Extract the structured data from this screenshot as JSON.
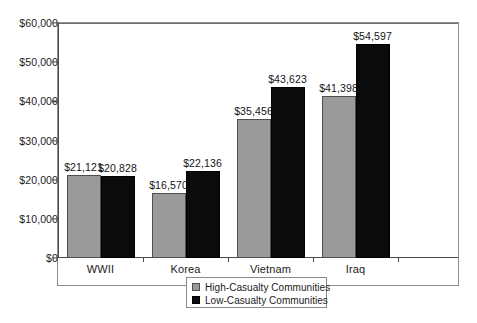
{
  "chart_data": {
    "type": "bar",
    "title": "",
    "subtitle": "",
    "xlabel": "",
    "ylabel": "",
    "categories": [
      "WWII",
      "Korea",
      "Vietnam",
      "Iraq"
    ],
    "series": [
      {
        "name": "High-Casualty Communities",
        "color": "#9a9a9a",
        "values": [
          21121,
          20828,
          16570,
          22136
        ],
        "values_by_category": [
          21121,
          16570,
          35456,
          41398
        ],
        "labels": [
          "$21,121",
          "$16,570",
          "$35,456",
          "$41,398"
        ]
      },
      {
        "name": "Low-Casualty Communities",
        "color": "#0b0b0b",
        "values_by_category": [
          20828,
          22136,
          43623,
          54597
        ],
        "labels": [
          "$20,828",
          "$22,136",
          "$43,623",
          "$54,597"
        ]
      }
    ],
    "ylim": [
      0,
      60000
    ],
    "ytick_values": [
      0,
      10000,
      20000,
      30000,
      40000,
      50000,
      60000
    ],
    "ytick_labels": [
      "$0",
      "$10,000",
      "$20,000",
      "$30,000",
      "$40,000",
      "$50,000",
      "$60,000"
    ],
    "grid": false,
    "legend_position": "bottom-center",
    "axis_color": "#4a4a4a",
    "frame_color": "#8e8e8e",
    "background": "#ffffff"
  },
  "legend": {
    "items": [
      {
        "label": "High-Casualty Communities",
        "swatch": "high"
      },
      {
        "label": "Low-Casualty Communities",
        "swatch": "low"
      }
    ]
  }
}
